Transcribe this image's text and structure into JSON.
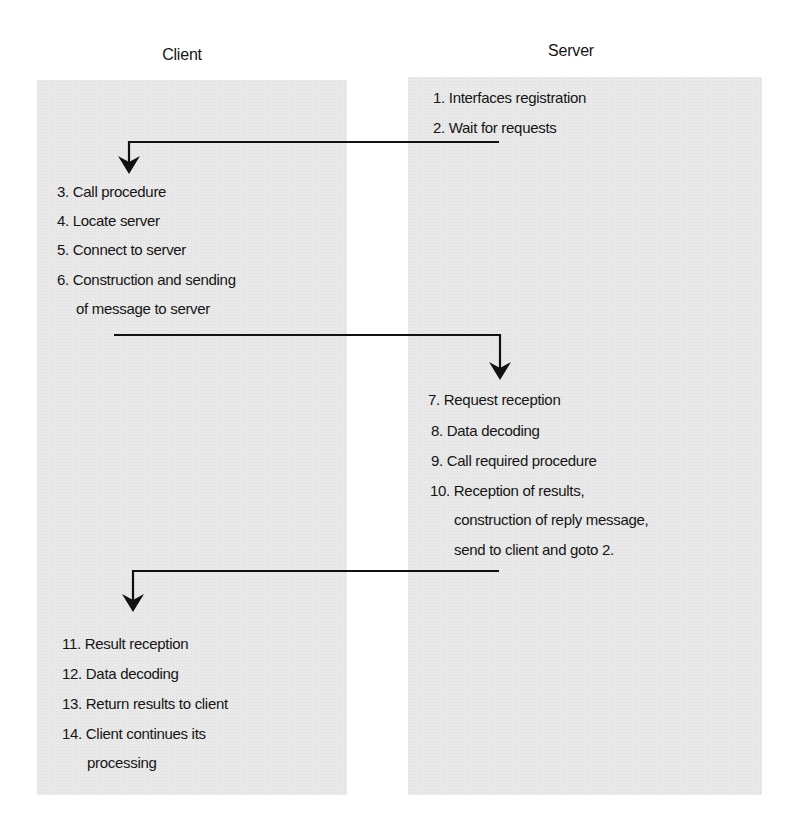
{
  "diagram": {
    "type": "client-server RPC sequence",
    "columns": {
      "client": {
        "title": "Client"
      },
      "server": {
        "title": "Server"
      }
    },
    "server_steps_initial": [
      "1. Interfaces registration",
      "2. Wait for requests"
    ],
    "client_steps_call": [
      "3. Call procedure",
      "4. Locate server",
      "5. Connect to server",
      "6. Construction and sending",
      "of message to server"
    ],
    "server_steps_handle": [
      "7. Request reception",
      "8. Data decoding",
      "9. Call required procedure",
      "10. Reception of results,",
      "construction of reply message,",
      "send to client and goto 2."
    ],
    "client_steps_result": [
      "11. Result reception",
      "12. Data decoding",
      "13. Return results to client",
      "14. Client continues its",
      "processing"
    ],
    "arrows": [
      {
        "from": "server step 2",
        "to": "client step 3"
      },
      {
        "from": "client step 6",
        "to": "server step 7"
      },
      {
        "from": "server step 10",
        "to": "client step 11"
      }
    ],
    "colors": {
      "panel": "#e9e9e9",
      "text": "#151515",
      "arrow": "#111111"
    }
  }
}
